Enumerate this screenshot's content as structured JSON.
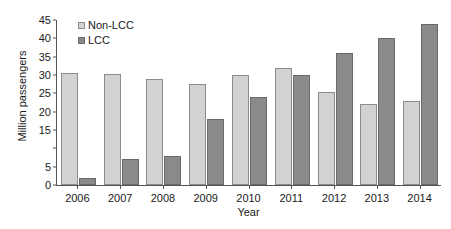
{
  "chart_data": {
    "type": "bar",
    "title": "",
    "xlabel": "Year",
    "ylabel": "Million passengers",
    "categories": [
      "2006",
      "2007",
      "2008",
      "2009",
      "2010",
      "2011",
      "2012",
      "2013",
      "2014"
    ],
    "series": [
      {
        "name": "Non-LCC",
        "color": "#d2d2d2",
        "values": [
          30.5,
          30.2,
          29.0,
          27.5,
          30.0,
          32.0,
          25.5,
          22.0,
          23.0
        ]
      },
      {
        "name": "LCC",
        "color": "#8a8a8a",
        "values": [
          2.0,
          7.0,
          8.0,
          18.0,
          24.0,
          30.0,
          36.0,
          40.0,
          44.0
        ]
      }
    ],
    "ylim": [
      0,
      45
    ],
    "y_ticks": [
      0,
      5,
      10,
      15,
      20,
      25,
      30,
      35,
      40,
      45
    ],
    "y_tick_labels": [
      "0",
      "5",
      "",
      "15",
      "20",
      "25",
      "30",
      "35",
      "40",
      "45"
    ],
    "grid": false,
    "legend_position": "top-left"
  }
}
